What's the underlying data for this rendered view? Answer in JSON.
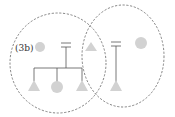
{
  "diagram": {
    "label": "(3b)",
    "colors": {
      "shape_fill": "#d2d2d2",
      "line": "#555555",
      "ellipse_stroke": "#666666"
    },
    "groups": [
      {
        "name": "left-group",
        "members": [
          "circle",
          "equals-marker",
          "triangle",
          "circle",
          "triangle"
        ]
      },
      {
        "name": "right-group",
        "members": [
          "triangle",
          "equals-marker",
          "triangle",
          "circle"
        ]
      }
    ]
  }
}
